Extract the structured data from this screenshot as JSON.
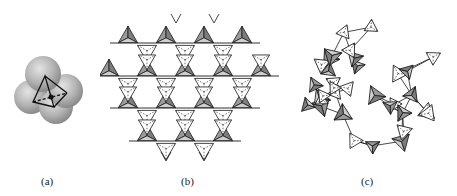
{
  "figure": {
    "panels": [
      {
        "id": "a",
        "label": "(a)",
        "description": "Space-filling model of SiO4 tetrahedron: four oxygen spheres with tetrahedron outline and central silicon atom"
      },
      {
        "id": "b",
        "label": "(b)",
        "description": "Ordered crystalline network of corner-sharing tetrahedra (hexagonal/kagome arrangement)"
      },
      {
        "id": "c",
        "label": "(c)",
        "description": "Disordered (amorphous/glassy) network of corner-sharing tetrahedra"
      }
    ],
    "colors": {
      "sphere_light": "#d9d9d9",
      "sphere_dark": "#8f8f8f",
      "shaded_face": "#9a9a9a",
      "light_face": "#cfcfcf",
      "line": "#1a1a1a",
      "background": "#ffffff"
    }
  }
}
